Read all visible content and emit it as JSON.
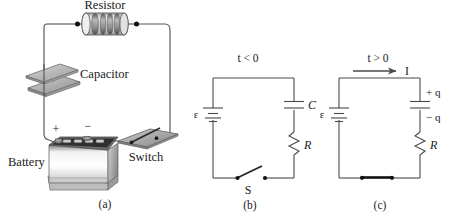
{
  "figure": {
    "background_color": "#ffffff",
    "ink_color": "#4a4a4a",
    "panels": [
      {
        "id": "a",
        "caption": "(a)",
        "type": "pictorial",
        "components": [
          {
            "name": "resistor",
            "label": "Resistor"
          },
          {
            "name": "capacitor",
            "label": "Capacitor"
          },
          {
            "name": "battery",
            "label": "Battery"
          },
          {
            "name": "switch",
            "label": "Switch"
          }
        ],
        "terminal_labels": {
          "positive": "+",
          "negative": "−"
        }
      },
      {
        "id": "b",
        "caption": "(b)",
        "type": "schematic",
        "time_label": "t < 0",
        "switch_state": "open",
        "components": [
          {
            "name": "emf-source",
            "label": "ε"
          },
          {
            "name": "capacitor",
            "label": "C"
          },
          {
            "name": "resistor",
            "label": "R"
          },
          {
            "name": "switch",
            "label": "S"
          }
        ]
      },
      {
        "id": "c",
        "caption": "(c)",
        "type": "schematic",
        "time_label": "t > 0",
        "switch_state": "closed",
        "current_label": "I",
        "components": [
          {
            "name": "emf-source",
            "label": "ε"
          },
          {
            "name": "capacitor",
            "label": ""
          },
          {
            "name": "resistor",
            "label": "R"
          }
        ],
        "charge_labels": {
          "top": "+ q",
          "bottom": "− q"
        }
      }
    ]
  },
  "colors": {
    "wire": "#4a4a4a",
    "plate_top": "#b9b9b9",
    "plate_side": "#8e8e8e",
    "battery_case": "#d9d9d9",
    "battery_top": "#3a3a3a",
    "resistor_body": "#e8e8e8",
    "band_dark": "#6d6d6d"
  }
}
